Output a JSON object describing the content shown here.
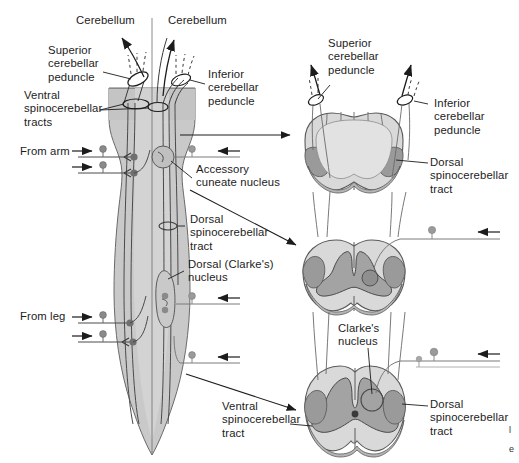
{
  "figure": {
    "colors": {
      "ink": "#1c1c1c",
      "outline": "#4a4a4a",
      "cord_fill": "#c9c9c9",
      "section_fill": "#d9d9d9",
      "gray_matter": "#a3a3a3",
      "tract_shade": "#9a9a9a",
      "neuron": "#8a8a8a",
      "background": "#ffffff"
    }
  },
  "labels": {
    "cerebellum_left": "Cerebellum",
    "cerebellum_right": "Cerebellum",
    "superior_cerebellar_peduncle_left": "Superior\ncerebellar\npeduncle",
    "inferior_cerebellar_peduncle_left": "Inferior\ncerebellar\npeduncle",
    "ventral_spinocerebellar_tracts": "Ventral\nspinocerebellar\ntracts",
    "from_arm": "From arm",
    "from_leg": "From leg",
    "accessory_cuneate_nucleus": "Accessory\ncuneate nucleus",
    "dorsal_spinocerebellar_tract_left": "Dorsal\nspinocerebellar\ntract",
    "dorsal_clarkes_nucleus": "Dorsal (Clarke's)\nnucleus",
    "ventral_spinocerebellar_tract_bottom": "Ventral\nspinocerebellar\ntract",
    "superior_cerebellar_peduncle_right": "Superior\ncerebellar\npeduncle",
    "inferior_cerebellar_peduncle_right": "Inferior\ncerebellar\npeduncle",
    "dorsal_spinocerebellar_tract_medulla": "Dorsal\nspinocerebellar\ntract",
    "clarkes_nucleus": "Clarke's\nnucleus",
    "dorsal_spinocerebellar_tract_lumbar": "Dorsal\nspinocerebellar\ntract"
  },
  "caption": {
    "line1": "l",
    "line2": "e"
  },
  "sections": [
    {
      "name": "medulla",
      "level": "Medulla"
    },
    {
      "name": "cervical-cord",
      "level": "Cervical spinal cord"
    },
    {
      "name": "lumbar-cord",
      "level": "Lumbar spinal cord"
    }
  ]
}
